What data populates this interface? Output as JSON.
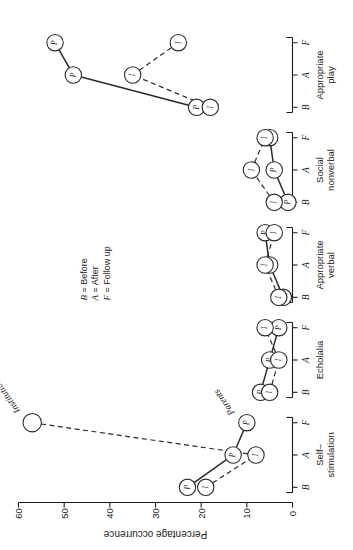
{
  "figure": {
    "orientation": "rotated-90-ccw",
    "legend": {
      "lines": [
        {
          "key": "B",
          "eq": "=",
          "text": "Before"
        },
        {
          "key": "A",
          "eq": "=",
          "text": "After"
        },
        {
          "key": "F",
          "eq": "=",
          "text": "Follow up"
        }
      ]
    },
    "annotations": [
      {
        "name": "institution-label",
        "text": "Institution"
      },
      {
        "name": "parents-label",
        "text": "Parents"
      }
    ]
  },
  "chart_data": {
    "type": "line",
    "title": "",
    "xlabel": "",
    "ylabel": "Percentage occurrence",
    "ylim": [
      0,
      60
    ],
    "yticks": [
      0,
      10,
      20,
      30,
      40,
      50,
      60
    ],
    "ytick_labels": [
      "0",
      "10",
      "20",
      "30",
      "40",
      "50",
      "60"
    ],
    "grid": false,
    "legend_position": "upper-middle",
    "phase_labels": [
      "B",
      "A",
      "F"
    ],
    "phase_names": [
      "Before",
      "After",
      "Follow up"
    ],
    "categories": [
      "Self–\nstimulation",
      "Echolalia",
      "Appropriate\nverbal",
      "Social\nnonverbal",
      "Appropriate\nplay"
    ],
    "category_lines": [
      [
        "Self–",
        "stimulation"
      ],
      [
        "Echolalia"
      ],
      [
        "Appropriate",
        "verbal"
      ],
      [
        "Social",
        "nonverbal"
      ],
      [
        "Appropriate",
        "play"
      ]
    ],
    "series": [
      {
        "name": "Parents",
        "marker_letter": "P",
        "line_style": "solid",
        "groups": [
          {
            "category": "Self–stimulation",
            "points": [
              {
                "phase": "B",
                "value": 23
              },
              {
                "phase": "A",
                "value": 13
              },
              {
                "phase": "F",
                "value": 10
              }
            ]
          },
          {
            "category": "Echolalia",
            "points": [
              {
                "phase": "B",
                "value": 7
              },
              {
                "phase": "A",
                "value": 5
              },
              {
                "phase": "F",
                "value": 3
              }
            ]
          },
          {
            "category": "Appropriate verbal",
            "points": [
              {
                "phase": "B",
                "value": 2
              },
              {
                "phase": "A",
                "value": 5
              },
              {
                "phase": "F",
                "value": 6
              }
            ]
          },
          {
            "category": "Social nonverbal",
            "points": [
              {
                "phase": "B",
                "value": 1
              },
              {
                "phase": "A",
                "value": 4
              },
              {
                "phase": "F",
                "value": 5
              }
            ]
          },
          {
            "category": "Appropriate play",
            "points": [
              {
                "phase": "B",
                "value": 21
              },
              {
                "phase": "A",
                "value": 48
              },
              {
                "phase": "F",
                "value": 52
              }
            ]
          }
        ]
      },
      {
        "name": "Institution",
        "marker_letter": "I",
        "line_style": "dashed",
        "groups": [
          {
            "category": "Self–stimulation",
            "points": [
              {
                "phase": "B",
                "value": 19
              },
              {
                "phase": "A",
                "value": 8
              },
              {
                "phase": "F",
                "value": 57
              }
            ]
          },
          {
            "category": "Echolalia",
            "points": [
              {
                "phase": "B",
                "value": 5
              },
              {
                "phase": "A",
                "value": 3
              },
              {
                "phase": "F",
                "value": 6
              }
            ]
          },
          {
            "category": "Appropriate verbal",
            "points": [
              {
                "phase": "B",
                "value": 3
              },
              {
                "phase": "A",
                "value": 6
              },
              {
                "phase": "F",
                "value": 4
              }
            ]
          },
          {
            "category": "Social nonverbal",
            "points": [
              {
                "phase": "B",
                "value": 4
              },
              {
                "phase": "A",
                "value": 9
              },
              {
                "phase": "F",
                "value": 6
              }
            ]
          },
          {
            "category": "Appropriate play",
            "points": [
              {
                "phase": "B",
                "value": 18
              },
              {
                "phase": "A",
                "value": 35
              },
              {
                "phase": "F",
                "value": 25
              }
            ]
          }
        ]
      }
    ]
  }
}
